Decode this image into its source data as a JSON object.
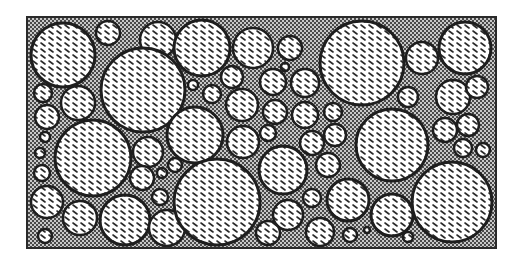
{
  "diagram": {
    "type": "particle-packing",
    "frame": {
      "x": 27,
      "y": 17,
      "width": 469,
      "height": 231
    },
    "colors": {
      "page_background": "#ffffff",
      "matrix_dark": "#4a4a4a",
      "matrix_light": "#c8c8c8",
      "frame_border": "#2a2a2a",
      "particle_fill": "#ffffff",
      "particle_outline": "#1e1e1e",
      "hatch": "#2a2a2a"
    },
    "particles": [
      {
        "cx": 63,
        "cy": 55,
        "r": 32
      },
      {
        "cx": 108,
        "cy": 33,
        "r": 12
      },
      {
        "cx": 158,
        "cy": 40,
        "r": 18
      },
      {
        "cx": 143,
        "cy": 90,
        "r": 42
      },
      {
        "cx": 43,
        "cy": 93,
        "r": 9
      },
      {
        "cx": 78,
        "cy": 103,
        "r": 17
      },
      {
        "cx": 47,
        "cy": 117,
        "r": 12
      },
      {
        "cx": 202,
        "cy": 48,
        "r": 28
      },
      {
        "cx": 253,
        "cy": 48,
        "r": 20
      },
      {
        "cx": 290,
        "cy": 48,
        "r": 12
      },
      {
        "cx": 285,
        "cy": 67,
        "r": 4
      },
      {
        "cx": 232,
        "cy": 77,
        "r": 11
      },
      {
        "cx": 193,
        "cy": 85,
        "r": 5
      },
      {
        "cx": 212,
        "cy": 94,
        "r": 9
      },
      {
        "cx": 242,
        "cy": 105,
        "r": 16
      },
      {
        "cx": 273,
        "cy": 82,
        "r": 13
      },
      {
        "cx": 305,
        "cy": 83,
        "r": 14
      },
      {
        "cx": 275,
        "cy": 112,
        "r": 12
      },
      {
        "cx": 305,
        "cy": 115,
        "r": 13
      },
      {
        "cx": 333,
        "cy": 112,
        "r": 9
      },
      {
        "cx": 362,
        "cy": 63,
        "r": 42
      },
      {
        "cx": 422,
        "cy": 58,
        "r": 16
      },
      {
        "cx": 465,
        "cy": 48,
        "r": 26
      },
      {
        "cx": 408,
        "cy": 97,
        "r": 10
      },
      {
        "cx": 453,
        "cy": 97,
        "r": 17
      },
      {
        "cx": 477,
        "cy": 87,
        "r": 11
      },
      {
        "cx": 93,
        "cy": 158,
        "r": 38
      },
      {
        "cx": 45,
        "cy": 137,
        "r": 5
      },
      {
        "cx": 40,
        "cy": 153,
        "r": 5
      },
      {
        "cx": 42,
        "cy": 173,
        "r": 8
      },
      {
        "cx": 47,
        "cy": 202,
        "r": 16
      },
      {
        "cx": 80,
        "cy": 218,
        "r": 17
      },
      {
        "cx": 45,
        "cy": 236,
        "r": 7
      },
      {
        "cx": 148,
        "cy": 152,
        "r": 15
      },
      {
        "cx": 175,
        "cy": 165,
        "r": 7
      },
      {
        "cx": 142,
        "cy": 178,
        "r": 12
      },
      {
        "cx": 162,
        "cy": 173,
        "r": 5
      },
      {
        "cx": 160,
        "cy": 197,
        "r": 8
      },
      {
        "cx": 125,
        "cy": 220,
        "r": 25
      },
      {
        "cx": 167,
        "cy": 228,
        "r": 18
      },
      {
        "cx": 195,
        "cy": 135,
        "r": 28
      },
      {
        "cx": 243,
        "cy": 142,
        "r": 16
      },
      {
        "cx": 268,
        "cy": 133,
        "r": 8
      },
      {
        "cx": 217,
        "cy": 202,
        "r": 43
      },
      {
        "cx": 283,
        "cy": 170,
        "r": 24
      },
      {
        "cx": 312,
        "cy": 143,
        "r": 12
      },
      {
        "cx": 328,
        "cy": 165,
        "r": 12
      },
      {
        "cx": 288,
        "cy": 215,
        "r": 15
      },
      {
        "cx": 268,
        "cy": 233,
        "r": 12
      },
      {
        "cx": 312,
        "cy": 198,
        "r": 9
      },
      {
        "cx": 320,
        "cy": 232,
        "r": 14
      },
      {
        "cx": 335,
        "cy": 135,
        "r": 11
      },
      {
        "cx": 392,
        "cy": 145,
        "r": 36
      },
      {
        "cx": 445,
        "cy": 130,
        "r": 12
      },
      {
        "cx": 468,
        "cy": 125,
        "r": 11
      },
      {
        "cx": 463,
        "cy": 148,
        "r": 9
      },
      {
        "cx": 483,
        "cy": 150,
        "r": 7
      },
      {
        "cx": 348,
        "cy": 200,
        "r": 21
      },
      {
        "cx": 392,
        "cy": 215,
        "r": 21
      },
      {
        "cx": 452,
        "cy": 202,
        "r": 40
      },
      {
        "cx": 350,
        "cy": 235,
        "r": 7
      },
      {
        "cx": 408,
        "cy": 237,
        "r": 5
      },
      {
        "cx": 367,
        "cy": 230,
        "r": 3
      }
    ]
  }
}
